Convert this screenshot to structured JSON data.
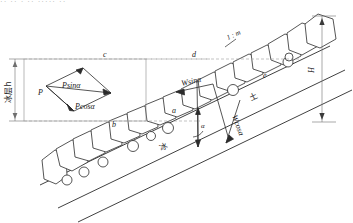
{
  "figure": {
    "title_fragment": "·· ·· · ·· ····· ··",
    "caption": "",
    "labels": {
      "ice_layer": "冰层h",
      "ice": "冰",
      "soil": "土",
      "height": "H",
      "slope_ratio": "1 : m",
      "alpha": "α",
      "force_p": "P",
      "p_sin": "Psinα",
      "p_cos": "Pcosα",
      "w_sin": "Wsinα",
      "w_cos": "Wcosα"
    },
    "points": [
      {
        "id": "a",
        "label": "a"
      },
      {
        "id": "b",
        "label": "b"
      },
      {
        "id": "c",
        "label": "c"
      },
      {
        "id": "d",
        "label": "d"
      },
      {
        "id": "e",
        "label": "e"
      }
    ],
    "colors": {
      "line": "#2b2b2b",
      "dimension": "#6f6f6f",
      "dashed": "#9a9a9a",
      "background": "#ffffff"
    }
  }
}
